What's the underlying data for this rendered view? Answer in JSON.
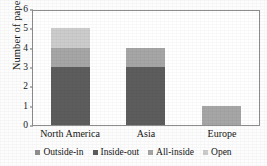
{
  "chart_data": {
    "type": "bar",
    "subtype": "stacked-bar",
    "title": "",
    "xlabel": "",
    "ylabel": "Number of papers",
    "categories": [
      "North America",
      "Asia",
      "Europe"
    ],
    "ylim": [
      0,
      6
    ],
    "yticks": [
      0,
      1,
      2,
      3,
      4,
      5,
      6
    ],
    "ytick_labels": [
      "0",
      "1",
      "2",
      "3",
      "4",
      "5",
      "6"
    ],
    "grid": false,
    "legend_position": "bottom",
    "series": [
      {
        "name": "Outside-in",
        "color": "#8f8f8f",
        "values": [
          0,
          0,
          0
        ]
      },
      {
        "name": "Inside-out",
        "color": "#5d5d5d",
        "values": [
          3,
          3,
          0
        ]
      },
      {
        "name": "All-inside",
        "color": "#a6a6a6",
        "values": [
          1,
          1,
          1
        ]
      },
      {
        "name": "Open",
        "color": "#cccccc",
        "values": [
          1,
          0,
          0
        ]
      }
    ],
    "totals": [
      5,
      4,
      1
    ]
  },
  "axes": {
    "frame_color": "#8d8d8d",
    "background": "#ffffff"
  }
}
